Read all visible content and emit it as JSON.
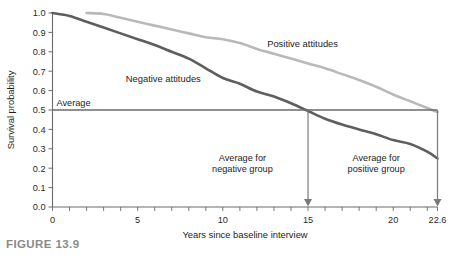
{
  "figure": {
    "caption": "FIGURE 13.9"
  },
  "chart_data": {
    "type": "line",
    "title": "",
    "xlabel": "Years since baseline interview",
    "ylabel": "Survival probability",
    "xlim": [
      0,
      22.6
    ],
    "ylim": [
      0.0,
      1.0
    ],
    "grid": false,
    "legend_position": "inline-annotation",
    "x_major_ticks": [
      0,
      5,
      10,
      15,
      20,
      22.6
    ],
    "x_major_tick_labels": [
      "0",
      "5",
      "10",
      "15",
      "20",
      "22.6"
    ],
    "x_minor_tick_step": 1,
    "y_ticks": [
      0.0,
      0.1,
      0.2,
      0.3,
      0.4,
      0.5,
      0.6,
      0.7,
      0.8,
      0.9,
      1.0
    ],
    "y_tick_labels": [
      "0.0",
      "0.1",
      "0.2",
      "0.3",
      "0.4",
      "0.5",
      "0.6",
      "0.7",
      "0.8",
      "0.9",
      "1.0"
    ],
    "series": [
      {
        "name": "Positive attitudes",
        "color": "#b9b9b9",
        "label_x": 12.6,
        "label_y": 0.825,
        "points": [
          [
            2.0,
            1.0
          ],
          [
            3.0,
            0.995
          ],
          [
            4.0,
            0.975
          ],
          [
            5.0,
            0.955
          ],
          [
            6.0,
            0.935
          ],
          [
            7.0,
            0.915
          ],
          [
            8.0,
            0.895
          ],
          [
            9.0,
            0.875
          ],
          [
            10.0,
            0.865
          ],
          [
            11.0,
            0.845
          ],
          [
            12.0,
            0.815
          ],
          [
            13.0,
            0.79
          ],
          [
            14.0,
            0.765
          ],
          [
            15.0,
            0.74
          ],
          [
            16.0,
            0.715
          ],
          [
            17.0,
            0.685
          ],
          [
            18.0,
            0.655
          ],
          [
            19.0,
            0.62
          ],
          [
            20.0,
            0.58
          ],
          [
            21.0,
            0.545
          ],
          [
            22.0,
            0.51
          ],
          [
            22.6,
            0.49
          ]
        ]
      },
      {
        "name": "Negative attitudes",
        "color": "#5e5e5e",
        "label_x": 4.3,
        "label_y": 0.645,
        "points": [
          [
            0.0,
            1.0
          ],
          [
            1.0,
            0.985
          ],
          [
            2.0,
            0.955
          ],
          [
            3.0,
            0.925
          ],
          [
            4.0,
            0.895
          ],
          [
            5.0,
            0.865
          ],
          [
            6.0,
            0.835
          ],
          [
            7.0,
            0.8
          ],
          [
            8.0,
            0.765
          ],
          [
            9.0,
            0.715
          ],
          [
            10.0,
            0.665
          ],
          [
            11.0,
            0.635
          ],
          [
            12.0,
            0.595
          ],
          [
            13.0,
            0.57
          ],
          [
            14.0,
            0.535
          ],
          [
            15.0,
            0.495
          ],
          [
            16.0,
            0.455
          ],
          [
            17.0,
            0.425
          ],
          [
            18.0,
            0.4
          ],
          [
            19.0,
            0.375
          ],
          [
            20.0,
            0.345
          ],
          [
            21.0,
            0.325
          ],
          [
            22.0,
            0.285
          ],
          [
            22.6,
            0.25
          ]
        ]
      }
    ],
    "reference_line": {
      "name": "Average",
      "label": "Average",
      "y_value": 0.5,
      "color": "#6b6b6b"
    },
    "annotations": [
      {
        "name": "average-negative-group",
        "line1": "Average for",
        "line2": "negative group",
        "x_value": 15,
        "text_x": 11.15,
        "text_y": 0.235
      },
      {
        "name": "average-positive-group",
        "line1": "Average for",
        "line2": "positive group",
        "x_value": 22.6,
        "text_x": 19.0,
        "text_y": 0.235
      }
    ]
  }
}
